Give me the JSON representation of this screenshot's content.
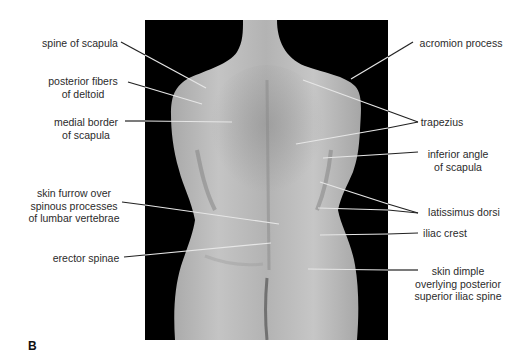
{
  "figure": {
    "panel_letter": "B",
    "photo": {
      "description": "posterior view of trunk (back), grayscale photograph on black background",
      "background_color": "#000000",
      "skin_color": "#bdbdbd"
    },
    "labels_left": [
      {
        "id": "spine-of-scapula",
        "text": "spine of scapula"
      },
      {
        "id": "posterior-fibers-of-deltoid",
        "text": "posterior fibers\nof deltoid"
      },
      {
        "id": "medial-border-of-scapula",
        "text": "medial border\nof scapula"
      },
      {
        "id": "skin-furrow",
        "text": "skin furrow over\nspinous processes\nof lumbar vertebrae"
      },
      {
        "id": "erector-spinae",
        "text": "erector spinae"
      }
    ],
    "labels_right": [
      {
        "id": "acromion-process",
        "text": "acromion process"
      },
      {
        "id": "trapezius",
        "text": "trapezius"
      },
      {
        "id": "inferior-angle-of-scapula",
        "text": "inferior angle\nof scapula"
      },
      {
        "id": "latissimus-dorsi",
        "text": "latissimus dorsi"
      },
      {
        "id": "iliac-crest",
        "text": "iliac crest"
      },
      {
        "id": "skin-dimple",
        "text": "skin dimple\noverlying posterior\nsuperior iliac spine"
      }
    ]
  }
}
